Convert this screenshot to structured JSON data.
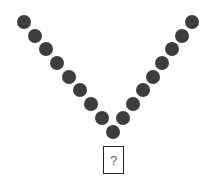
{
  "diagram": {
    "dot_color": "#3d3d3d",
    "dot_diameter": 14,
    "left_arm": [
      {
        "x": 24,
        "y": 22
      },
      {
        "x": 35,
        "y": 36
      },
      {
        "x": 46,
        "y": 49
      },
      {
        "x": 57,
        "y": 63
      },
      {
        "x": 69,
        "y": 77
      },
      {
        "x": 80,
        "y": 90
      },
      {
        "x": 91,
        "y": 104
      },
      {
        "x": 102,
        "y": 118
      }
    ],
    "bottom_dot": {
      "x": 113,
      "y": 132
    },
    "right_arm": [
      {
        "x": 192,
        "y": 22
      },
      {
        "x": 182,
        "y": 36
      },
      {
        "x": 172,
        "y": 49
      },
      {
        "x": 162,
        "y": 63
      },
      {
        "x": 153,
        "y": 77
      },
      {
        "x": 143,
        "y": 90
      },
      {
        "x": 133,
        "y": 104
      },
      {
        "x": 123,
        "y": 118
      }
    ],
    "answer_box": {
      "label": "?"
    }
  }
}
